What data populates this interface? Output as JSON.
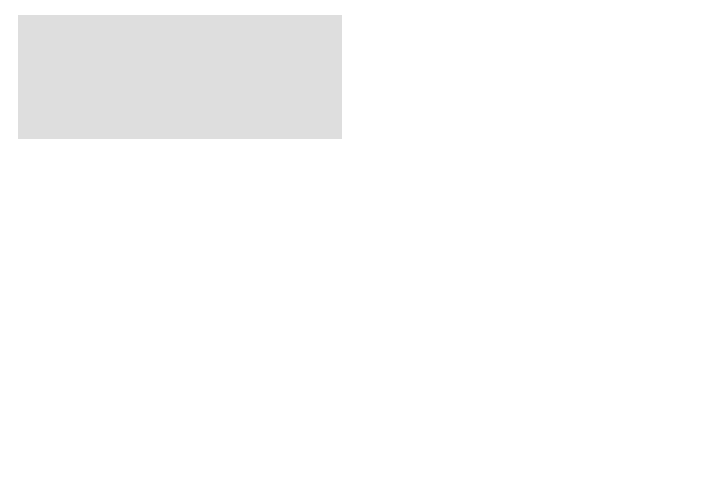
{
  "zones": {
    "cortex": "Cortex",
    "outer_medulla": "Outer medulla",
    "inner_medulla": "Inner medulla",
    "vasopressin_box": [
      "Vasopressin",
      "present"
    ]
  },
  "labels": {
    "distal_tubule": [
      "Distal",
      "tubule"
    ],
    "descending_limb": [
      "Descending",
      "limb of",
      "long Henle's",
      "loop"
    ],
    "thick_ascending": [
      "Thick portion",
      "of ascending",
      "limb of long",
      "Henle's loop"
    ],
    "thin_ascending": [
      "Thin portion",
      "of ascending",
      "limb of long",
      "Henle's loop"
    ],
    "interstitial_fluid": [
      "Interstitial",
      "fluid"
    ],
    "collecting_tubule": [
      "Collecting",
      "tubule"
    ]
  },
  "transport": {
    "water": "H",
    "water_sub": "2",
    "water_o": "O",
    "salt": "NaCl",
    "urea": "Urea",
    "star": "★"
  },
  "urine_output": {
    "main": "Urea",
    "line2": "in",
    "line3": "urine"
  },
  "legend": [
    {
      "symbol": "active-transport-symbol",
      "text": "= active transport"
    },
    {
      "symbol": "passive-diffusion-arrow",
      "text": "= passive diffusion"
    },
    {
      "symbol": "impermeable-bar",
      "text": "= portions of tubule impermeable to urea"
    },
    {
      "symbol": "star",
      "text": "= permeability increased by vasopressin"
    }
  ],
  "colors": {
    "cortex_bg": "#dcdcdc",
    "outer_medulla_bg": "#bdbdbd",
    "inner_medulla_bg": "#a9a9a9",
    "tubule_lumen": "#ececec",
    "impermeable_wall": "#6e6e6e",
    "urea_arrow": "#9a9a9a"
  }
}
